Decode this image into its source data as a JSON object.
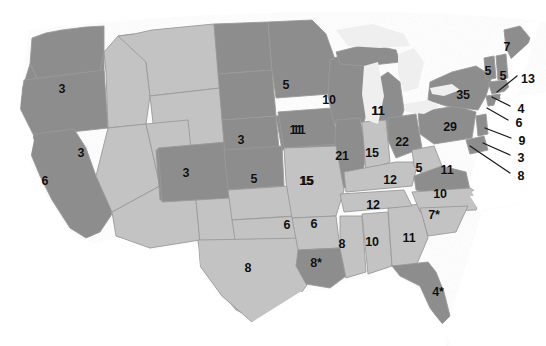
{
  "map": {
    "title": "United States electoral vote map",
    "colors": {
      "shaded_dark": "#8d8d8d",
      "shaded_light": "#c3c3c3",
      "border": "#9a9a9a",
      "background": "#ffffff",
      "label": "#0e0e0e",
      "leader_line": "#1a1a1a",
      "lake": "#efefef"
    },
    "footnote_marker": "*",
    "states": [
      {
        "code": "WA",
        "label": "3",
        "x": 62,
        "y": 89,
        "shade": "dark"
      },
      {
        "code": "OR",
        "label": "3",
        "x": 81,
        "y": 153,
        "shade": "dark"
      },
      {
        "code": "CA",
        "label": "6",
        "x": 45,
        "y": 181,
        "shade": "dark"
      },
      {
        "code": "ID",
        "label": "",
        "x": 0,
        "y": 0,
        "shade": "light"
      },
      {
        "code": "MT",
        "label": "",
        "x": 0,
        "y": 0,
        "shade": "light"
      },
      {
        "code": "NV",
        "label": "",
        "x": 0,
        "y": 0,
        "shade": "light"
      },
      {
        "code": "UT",
        "label": "",
        "x": 0,
        "y": 0,
        "shade": "light"
      },
      {
        "code": "AZ",
        "label": "",
        "x": 0,
        "y": 0,
        "shade": "light"
      },
      {
        "code": "NM",
        "label": "",
        "x": 0,
        "y": 0,
        "shade": "light"
      },
      {
        "code": "WY",
        "label": "3",
        "x": 241,
        "y": 140,
        "shade": "dark"
      },
      {
        "code": "CO",
        "label": "3",
        "x": 186,
        "y": 173,
        "shade": "dark"
      },
      {
        "code": "ND",
        "label": "5",
        "x": 286,
        "y": 85,
        "shade": "dark"
      },
      {
        "code": "SD",
        "label": "11",
        "x": 299,
        "y": 130,
        "shade": "dark"
      },
      {
        "code": "NE",
        "label": "5",
        "x": 254,
        "y": 179,
        "shade": "dark"
      },
      {
        "code": "KS",
        "label": "15",
        "x": 306,
        "y": 181,
        "shade": "light"
      },
      {
        "code": "OK",
        "label": "6",
        "x": 287,
        "y": 225,
        "shade": "light"
      },
      {
        "code": "TX",
        "label": "8",
        "x": 248,
        "y": 268,
        "shade": "light"
      },
      {
        "code": "MN",
        "label": "10",
        "x": 329,
        "y": 100,
        "shade": "dark"
      },
      {
        "code": "IA",
        "label": "11",
        "x": 296,
        "y": 130,
        "shade": "dark"
      },
      {
        "code": "WI",
        "label": "11",
        "x": 378,
        "y": 111,
        "shade": "light"
      },
      {
        "code": "IL",
        "label": "21",
        "x": 342,
        "y": 156,
        "shade": "dark"
      },
      {
        "code": "IN",
        "label": "15",
        "x": 372,
        "y": 153,
        "shade": "light"
      },
      {
        "code": "MI",
        "label": "11",
        "x": 378,
        "y": 111,
        "shade": "light"
      },
      {
        "code": "OH",
        "label": "22",
        "x": 402,
        "y": 142,
        "shade": "dark"
      },
      {
        "code": "MO",
        "label": "15",
        "x": 307,
        "y": 181,
        "shade": "light"
      },
      {
        "code": "KY",
        "label": "12",
        "x": 390,
        "y": 180,
        "shade": "light"
      },
      {
        "code": "WV",
        "label": "5",
        "x": 419,
        "y": 168,
        "shade": "light"
      },
      {
        "code": "TN",
        "label": "12",
        "x": 373,
        "y": 205,
        "shade": "light"
      },
      {
        "code": "AR",
        "label": "6",
        "x": 314,
        "y": 224,
        "shade": "light"
      },
      {
        "code": "LA",
        "label": "8",
        "x": 316,
        "y": 263,
        "shade": "dark",
        "footnote": true
      },
      {
        "code": "MS",
        "label": "8",
        "x": 342,
        "y": 244,
        "shade": "light"
      },
      {
        "code": "AL",
        "label": "10",
        "x": 372,
        "y": 242,
        "shade": "light"
      },
      {
        "code": "GA",
        "label": "11",
        "x": 409,
        "y": 238,
        "shade": "light"
      },
      {
        "code": "FL",
        "label": "4",
        "x": 438,
        "y": 292,
        "shade": "dark",
        "footnote": true
      },
      {
        "code": "SC",
        "label": "10",
        "x": 440,
        "y": 194,
        "shade": "light"
      },
      {
        "code": "NC",
        "label": "11",
        "x": 447,
        "y": 170,
        "shade": "light"
      },
      {
        "code": "VA",
        "label": "7",
        "x": 434,
        "y": 215,
        "shade": "dark",
        "footnote": true
      },
      {
        "code": "PA",
        "label": "29",
        "x": 450,
        "y": 127,
        "shade": "dark"
      },
      {
        "code": "NY",
        "label": "35",
        "x": 463,
        "y": 95,
        "shade": "dark"
      },
      {
        "code": "VT",
        "label": "5",
        "x": 488,
        "y": 71,
        "shade": "dark"
      },
      {
        "code": "NH",
        "label": "5",
        "x": 503,
        "y": 76,
        "shade": "dark"
      },
      {
        "code": "ME",
        "label": "7",
        "x": 507,
        "y": 47,
        "shade": "dark"
      }
    ],
    "leader_states": [
      {
        "code": "MA",
        "label": "13",
        "lx": 528,
        "ly": 79,
        "px": 497,
        "py": 92
      },
      {
        "code": "RI",
        "label": "4",
        "lx": 521,
        "ly": 109,
        "px": 492,
        "py": 97
      },
      {
        "code": "CT",
        "label": "6",
        "lx": 519,
        "ly": 123,
        "px": 487,
        "py": 108
      },
      {
        "code": "NJ",
        "label": "9",
        "lx": 522,
        "ly": 141,
        "px": 485,
        "py": 128
      },
      {
        "code": "DE",
        "label": "3",
        "lx": 521,
        "ly": 158,
        "px": 483,
        "py": 143
      },
      {
        "code": "MD",
        "label": "8",
        "lx": 521,
        "ly": 176,
        "px": 470,
        "py": 146
      }
    ]
  }
}
